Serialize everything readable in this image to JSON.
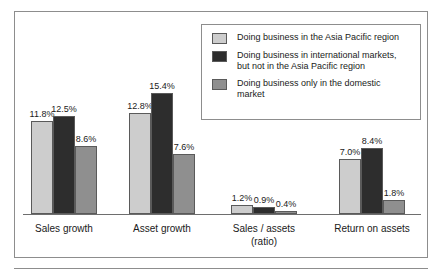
{
  "chart_data": {
    "type": "bar",
    "title": "",
    "subtitle": "",
    "xlabel": "",
    "ylabel": "",
    "grid": false,
    "legend_position": "top-right",
    "ylim": [
      0,
      15.4
    ],
    "categories": [
      "Sales growth",
      "Asset growth",
      "Sales / assets\n(ratio)",
      "Return on assets"
    ],
    "category_lines": [
      [
        "Sales growth"
      ],
      [
        "Asset growth"
      ],
      [
        "Sales / assets",
        "(ratio)"
      ],
      [
        "Return on assets"
      ]
    ],
    "series": [
      {
        "name": "Doing business in the Asia Pacific region",
        "color": "#cdcdcd",
        "values": [
          11.8,
          12.8,
          1.2,
          7.0
        ],
        "labels": [
          "11.8%",
          "12.8%",
          "1.2%",
          "7.0%"
        ]
      },
      {
        "name": "Doing business in international markets, but not in the Asia Pacific region",
        "color": "#2d2d2d",
        "values": [
          12.5,
          15.4,
          0.9,
          8.4
        ],
        "labels": [
          "12.5%",
          "15.4%",
          "0.9%",
          "8.4%"
        ]
      },
      {
        "name": "Doing business only in the domestic market",
        "color": "#8f8f8f",
        "values": [
          8.6,
          7.6,
          0.4,
          1.8
        ],
        "labels": [
          "8.6%",
          "7.6%",
          "0.4%",
          "1.8%"
        ]
      }
    ]
  },
  "legend": {
    "items": [
      {
        "swatch": "#cdcdcd",
        "lines": [
          "Doing business in the Asia Pacific region"
        ]
      },
      {
        "swatch": "#2d2d2d",
        "lines": [
          "Doing business in international markets,",
          "but not in the Asia Pacific region"
        ]
      },
      {
        "swatch": "#8f8f8f",
        "lines": [
          "Doing business only in the domestic",
          "market"
        ]
      }
    ]
  },
  "colors": {
    "series_1": "#cdcdcd",
    "series_2": "#2d2d2d",
    "series_3": "#8f8f8f",
    "frame": "#8d8d8d",
    "axis": "#6e6e6e",
    "text": "#1a1a1a"
  }
}
